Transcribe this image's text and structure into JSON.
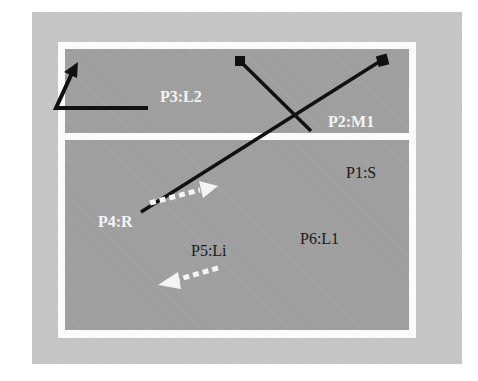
{
  "diagram": {
    "colors": {
      "outer_background": "#c4c4c4",
      "frame": "#fbfbfb",
      "region": "#9d9d9d",
      "line": "#111111",
      "light_arrow": "#f4f4f4",
      "dark_label": "#1a1a1a"
    },
    "regions": [
      {
        "id": "top",
        "labels": [
          "P3:L2",
          "P2:M1"
        ]
      },
      {
        "id": "bottom",
        "labels": [
          "P1:S",
          "P4:R",
          "P5:Li",
          "P6:L1"
        ]
      }
    ],
    "labels": {
      "p3": "P3:L2",
      "p2": "P2:M1",
      "p1": "P1:S",
      "p4": "P4:R",
      "p5": "P5:Li",
      "p6": "P6:L1"
    },
    "shapes": [
      {
        "name": "bent-arrow-l2",
        "type": "polyline-arrow",
        "color": "dark"
      },
      {
        "name": "diagonal-line-1",
        "type": "line-with-square-end",
        "color": "dark"
      },
      {
        "name": "diagonal-line-2",
        "type": "line-with-square-end",
        "color": "dark"
      },
      {
        "name": "dotted-arrow-right",
        "type": "dotted-arrow",
        "color": "light"
      },
      {
        "name": "dotted-arrow-left",
        "type": "dotted-arrow",
        "color": "light"
      }
    ]
  }
}
